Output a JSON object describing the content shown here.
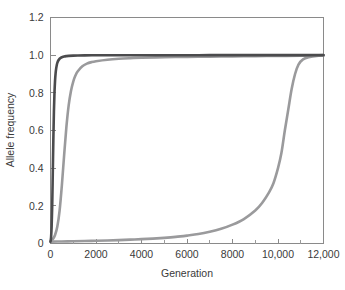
{
  "chart_data": {
    "type": "line",
    "title": "",
    "xlabel": "Generation",
    "ylabel": "Allele frequency",
    "xlim": [
      0,
      12000
    ],
    "ylim": [
      0,
      1.2
    ],
    "grid": false,
    "legend_position": "none",
    "x_ticks": [
      0,
      2000,
      4000,
      6000,
      8000,
      10000,
      12000
    ],
    "x_tick_labels": [
      "0",
      "2000",
      "4000",
      "6000",
      "8000",
      "10,000",
      "12,000"
    ],
    "x_minor_tick_interval": 1000,
    "y_ticks": [
      0,
      0.2,
      0.4,
      0.6,
      0.8,
      1.0,
      1.2
    ],
    "y_tick_labels": [
      "0",
      "0.2",
      "0.4",
      "0.6",
      "0.8",
      "1.0",
      "1.2"
    ],
    "series": [
      {
        "name": "strong-selection",
        "color": "#4b4b4d",
        "width": 2.6,
        "x": [
          0,
          25,
          50,
          75,
          100,
          125,
          150,
          175,
          200,
          225,
          250,
          275,
          300,
          350,
          400,
          450,
          500,
          600,
          700,
          800,
          1000,
          1200,
          1500,
          2000,
          2500,
          3000,
          4000,
          5000,
          6000,
          7000,
          8000,
          9000,
          10000,
          11000,
          12000
        ],
        "y": [
          0.01,
          0.033,
          0.09,
          0.2,
          0.37,
          0.55,
          0.7,
          0.8,
          0.865,
          0.905,
          0.93,
          0.947,
          0.959,
          0.973,
          0.981,
          0.986,
          0.989,
          0.993,
          0.995,
          0.9963,
          0.9976,
          0.9983,
          0.999,
          0.9994,
          0.9996,
          0.9997,
          0.9998,
          0.9999,
          0.9999,
          1.0,
          1.0,
          1.0,
          1.0,
          1.0,
          1.0
        ]
      },
      {
        "name": "moderate-selection",
        "color": "#9a9a9c",
        "width": 2.6,
        "x": [
          0,
          100,
          200,
          300,
          400,
          500,
          600,
          700,
          800,
          900,
          1000,
          1100,
          1200,
          1400,
          1600,
          1800,
          2000,
          2500,
          3000,
          3500,
          4000,
          5000,
          6000,
          7000,
          8000,
          9000,
          10000,
          11000,
          11600,
          12000
        ],
        "y": [
          0.01,
          0.022,
          0.045,
          0.09,
          0.175,
          0.31,
          0.47,
          0.62,
          0.735,
          0.81,
          0.86,
          0.893,
          0.915,
          0.941,
          0.955,
          0.963,
          0.968,
          0.976,
          0.981,
          0.984,
          0.986,
          0.989,
          0.991,
          0.9925,
          0.9938,
          0.9948,
          0.9957,
          0.9969,
          0.9985,
          1.0
        ]
      },
      {
        "name": "weak-selection",
        "color": "#9a9a9c",
        "width": 2.6,
        "x": [
          0,
          500,
          1000,
          1500,
          2000,
          2500,
          3000,
          3500,
          4000,
          4500,
          5000,
          5500,
          6000,
          6500,
          7000,
          7500,
          8000,
          8500,
          9000,
          9300,
          9600,
          9800,
          10000,
          10150,
          10300,
          10450,
          10600,
          10750,
          10900,
          11100,
          11400,
          11700,
          12000
        ],
        "y": [
          0.01,
          0.011,
          0.012,
          0.013,
          0.0145,
          0.016,
          0.018,
          0.0205,
          0.023,
          0.026,
          0.03,
          0.035,
          0.042,
          0.05,
          0.062,
          0.078,
          0.1,
          0.13,
          0.175,
          0.215,
          0.27,
          0.32,
          0.4,
          0.48,
          0.6,
          0.71,
          0.82,
          0.9,
          0.95,
          0.978,
          0.99,
          0.996,
          0.999
        ]
      }
    ]
  }
}
